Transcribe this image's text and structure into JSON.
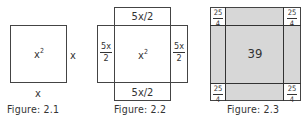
{
  "figures": [
    {
      "caption": "Figure: 2.1",
      "center_label_base": "x",
      "center_label_exp": "2",
      "right_label": "x",
      "bottom_label": "x"
    },
    {
      "caption": "Figure: 2.2",
      "center_label_base": "x",
      "center_label_exp": "2",
      "top_label": "5x/2",
      "bottom_label": "5x/2",
      "left_label": {
        "num": "5x",
        "den": "2"
      },
      "right_label": {
        "num": "5x",
        "den": "2"
      }
    },
    {
      "caption": "Figure: 2.3",
      "center_label": "39",
      "corner_labels": [
        {
          "num": "25",
          "den": "4"
        },
        {
          "num": "25",
          "den": "4"
        },
        {
          "num": "25",
          "den": "4"
        },
        {
          "num": "25",
          "den": "4"
        }
      ],
      "shade_color": "#d7d7d7"
    }
  ]
}
